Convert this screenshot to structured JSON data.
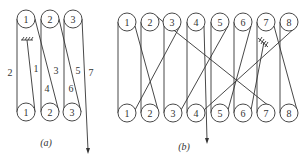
{
  "top_cut_text": "……",
  "diagram_a": {
    "caption": "(a)",
    "top_pulleys": [
      "1",
      "2",
      "3"
    ],
    "bottom_pulleys": [
      "1",
      "2",
      "3"
    ],
    "segment_labels": [
      "1",
      "2",
      "3",
      "4",
      "5",
      "6",
      "7"
    ]
  },
  "diagram_b": {
    "caption": "(b)",
    "top_pulleys": [
      "1",
      "2",
      "3",
      "4",
      "5",
      "6",
      "7",
      "8"
    ],
    "bottom_pulleys": [
      "1",
      "2",
      "3",
      "4",
      "5",
      "6",
      "7",
      "8"
    ]
  }
}
